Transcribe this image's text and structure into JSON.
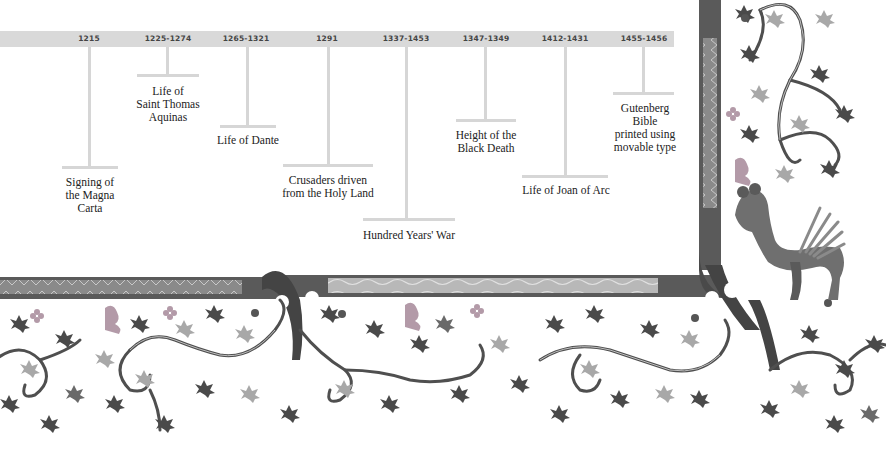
{
  "timeline": {
    "band_color": "#d9d9d9",
    "events": [
      {
        "date": "1215",
        "label": "Signing of\nthe Magna\nCarta"
      },
      {
        "date": "1225-1274",
        "label": "Life of\nSaint Thomas\nAquinas"
      },
      {
        "date": "1265-1321",
        "label": "Life of Dante"
      },
      {
        "date": "1291",
        "label": "Crusaders driven\nfrom the Holy Land"
      },
      {
        "date": "1337-1453",
        "label": "Hundred Years' War"
      },
      {
        "date": "1347-1349",
        "label": "Height of the\nBlack Death"
      },
      {
        "date": "1412-1431",
        "label": "Life of Joan of Arc"
      },
      {
        "date": "1455-1456",
        "label": "Gutenberg\nBible\nprinted using\nmovable type"
      }
    ]
  },
  "decoration": {
    "description": "Illuminated manuscript border with ivy vines and a winged creature",
    "border_color": "#555555",
    "panel_color": "#8c8c8c",
    "leaf_dark": "#4a4a4a",
    "leaf_light": "#a8a8a8",
    "accent_flower": "#b39aa8"
  }
}
